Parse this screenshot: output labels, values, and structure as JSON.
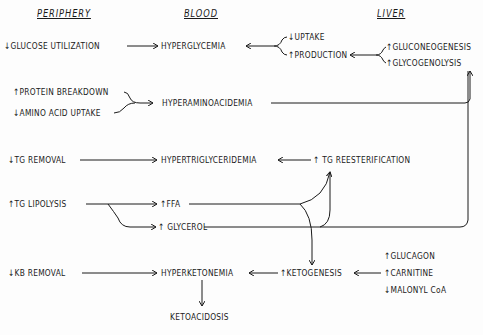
{
  "headers": {
    "periphery": "PERIPHERY",
    "blood": "BLOOD",
    "liver": "LIVER"
  },
  "periphery": {
    "glucose_utilization": "↓GLUCOSE UTILIZATION",
    "protein_breakdown": "↑PROTEIN BREAKDOWN",
    "amino_acid_uptake": "↓AMINO ACID UPTAKE",
    "tg_removal": "↓TG REMOVAL",
    "tg_lipolysis": "↑TG LIPOLYSIS",
    "kb_removal": "↓KB REMOVAL"
  },
  "blood": {
    "hyperglycemia": "HYPERGLYCEMIA",
    "hyperaminoacidemia": "HYPERAMINOACIDEMIA",
    "hypertriglyceridemia": "HYPERTRIGLYCERIDEMIA",
    "ffa": "↑FFA",
    "glycerol": "↑ GLYCEROL",
    "hyperketonemia": "HYPERKETONEMIA",
    "ketoacidosis": "KETOACIDOSIS"
  },
  "glucose_branch": {
    "uptake": "↓UPTAKE",
    "production": "↑PRODUCTION"
  },
  "liver": {
    "gluconeogenesis": "↑GLUCONEOGENESIS",
    "glycogenolysis": "↑GLYCOGENOLYSIS",
    "tg_reesterification": "↑ TG REESTERIFICATION",
    "ketogenesis": "↑KETOGENESIS",
    "glucagon": "↑GLUCAGON",
    "carnitine": "↑CARNITINE",
    "malonyl_coa": "↓MALONYL CoA"
  }
}
